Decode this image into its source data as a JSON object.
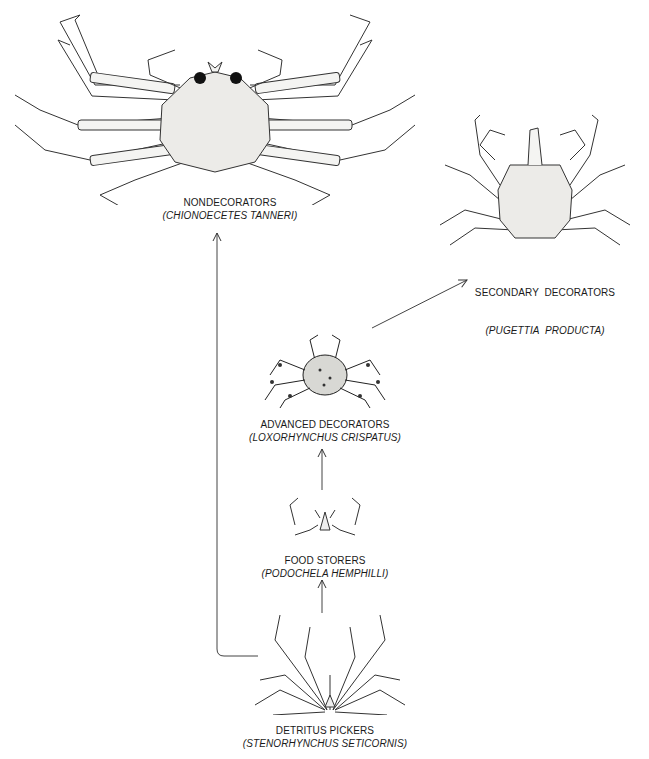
{
  "diagram": {
    "type": "evolutionary-flow",
    "nodes": [
      {
        "id": "nondecorators",
        "common": "NONDECORATORS",
        "species": "(CHIONOECETES TANNERI)"
      },
      {
        "id": "secondary",
        "common": "SECONDARY  DECORATORS",
        "species": "(PUGETTIA  PRODUCTA)"
      },
      {
        "id": "advanced",
        "common": "ADVANCED DECORATORS",
        "species": "(LOXORHYNCHUS CRISPATUS)"
      },
      {
        "id": "food",
        "common": "FOOD STORERS",
        "species": "(PODOCHELA HEMPHILLI)"
      },
      {
        "id": "detritus",
        "common": "DETRITUS PICKERS",
        "species": "(STENORHYNCHUS SETICORNIS)"
      }
    ],
    "edges": [
      {
        "from": "detritus",
        "to": "food"
      },
      {
        "from": "food",
        "to": "advanced"
      },
      {
        "from": "advanced",
        "to": "secondary"
      },
      {
        "from": "detritus",
        "to": "nondecorators"
      }
    ],
    "colors": {
      "ink": "#1a1a1a",
      "line": "#444444",
      "shell": "#f2f2f0"
    }
  }
}
